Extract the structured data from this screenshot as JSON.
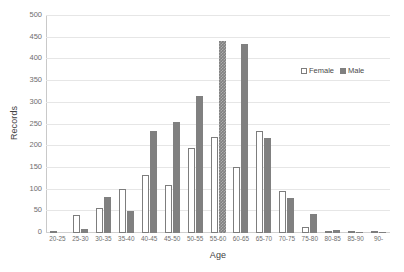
{
  "chart_data": {
    "type": "bar",
    "title": "",
    "xlabel": "Age",
    "ylabel": "Records",
    "ylim": [
      0,
      500
    ],
    "ytick_step": 50,
    "yticks": [
      0,
      50,
      100,
      150,
      200,
      250,
      300,
      350,
      400,
      450,
      500
    ],
    "grid": true,
    "legend_position": "top-right",
    "categories": [
      "20-25",
      "25-30",
      "30-35",
      "35-40",
      "40-45",
      "45-50",
      "50-55",
      "55-60",
      "60-65",
      "65-70",
      "70-75",
      "75-80",
      "80-85",
      "85-90",
      "90-"
    ],
    "series": [
      {
        "name": "Female",
        "color": "#ffffff",
        "border_color": "#7d7d7d",
        "values": [
          4,
          42,
          57,
          102,
          133,
          110,
          197,
          222,
          153,
          236,
          96,
          14,
          2,
          2,
          2
        ]
      },
      {
        "name": "Male",
        "color": "#808080",
        "values": [
          0,
          10,
          84,
          51,
          234,
          255,
          315,
          443,
          435,
          218,
          81,
          44,
          7,
          1,
          1
        ]
      }
    ],
    "highlighted_bar": {
      "series": "Male",
      "category": "55-60",
      "style": "hatched"
    }
  },
  "legend": {
    "items": [
      {
        "label": "Female",
        "swatch": "hollow-square"
      },
      {
        "label": "Male",
        "swatch": "filled-square"
      }
    ]
  },
  "axes": {
    "y_title": "Records",
    "x_title": "Age"
  }
}
